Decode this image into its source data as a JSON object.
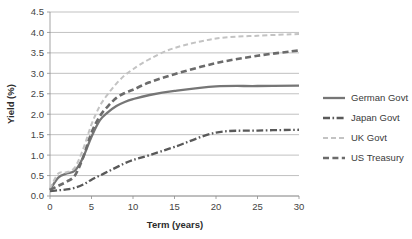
{
  "chart_data": {
    "type": "line",
    "title": "",
    "xlabel": "Term (years)",
    "ylabel": "Yield (%)",
    "xlim": [
      0,
      30
    ],
    "ylim": [
      0,
      4.5
    ],
    "xticks": [
      "0",
      "5",
      "10",
      "15",
      "20",
      "25",
      "30"
    ],
    "yticks": [
      "0.0",
      "0.5",
      "1.0",
      "1.5",
      "2.0",
      "2.5",
      "3.0",
      "3.5",
      "4.0",
      "4.5"
    ],
    "grid": "horizontal",
    "legend_position": "right",
    "x": [
      0,
      1,
      2,
      3,
      4,
      5,
      6,
      7,
      8,
      9,
      10,
      12,
      15,
      20,
      25,
      30
    ],
    "series": [
      {
        "name": "German Govt",
        "style": "solid",
        "color": "#767676",
        "values": [
          0.15,
          0.45,
          0.55,
          0.62,
          0.95,
          1.45,
          1.85,
          2.05,
          2.2,
          2.3,
          2.37,
          2.47,
          2.57,
          2.68,
          2.69,
          2.7
        ]
      },
      {
        "name": "Japan Govt",
        "style": "dash-dot",
        "color": "#595959",
        "values": [
          0.12,
          0.14,
          0.16,
          0.2,
          0.28,
          0.4,
          0.5,
          0.6,
          0.7,
          0.8,
          0.88,
          1.0,
          1.2,
          1.55,
          1.6,
          1.62
        ]
      },
      {
        "name": "UK Govt",
        "style": "dashed",
        "color": "#c3c3c3",
        "values": [
          0.18,
          0.55,
          0.58,
          0.7,
          1.15,
          1.75,
          2.2,
          2.5,
          2.75,
          2.95,
          3.1,
          3.35,
          3.62,
          3.85,
          3.92,
          3.96
        ]
      },
      {
        "name": "US Treasury",
        "style": "dashed-bold",
        "color": "#6b6b6b",
        "values": [
          0.15,
          0.25,
          0.35,
          0.5,
          0.95,
          1.55,
          1.95,
          2.2,
          2.4,
          2.52,
          2.6,
          2.78,
          2.98,
          3.25,
          3.43,
          3.56
        ]
      }
    ]
  },
  "legend": {
    "items": [
      {
        "label": "German Govt"
      },
      {
        "label": "Japan Govt"
      },
      {
        "label": "UK Govt"
      },
      {
        "label": "US Treasury"
      }
    ]
  }
}
